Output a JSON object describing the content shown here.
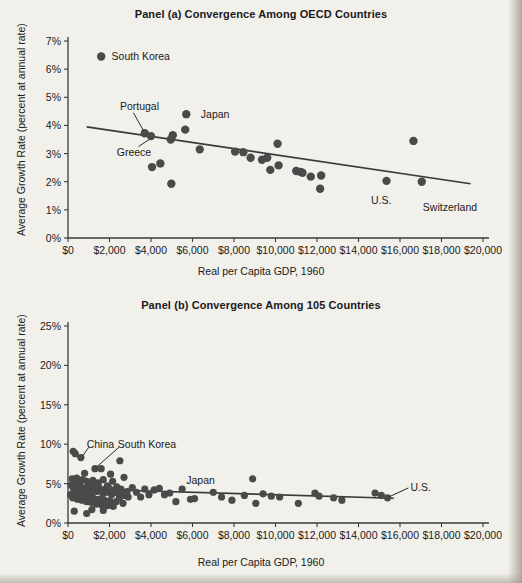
{
  "figure": {
    "xlabel": "Real per Capita GDP, 1960",
    "ylabel": "Average Growth Rate (percent at annual rate)"
  },
  "chart_data": [
    {
      "type": "scatter",
      "panel": "a",
      "title": "Panel (a) Convergence Among OECD Countries",
      "xlabel": "Real per Capita GDP, 1960",
      "ylabel": "Average Growth Rate (percent at annual rate)",
      "xlim": [
        0,
        20000
      ],
      "ylim": [
        0,
        7
      ],
      "grid": false,
      "legend": "none",
      "xticks": [
        0,
        2000,
        4000,
        6000,
        8000,
        10000,
        12000,
        14000,
        16000,
        18000,
        20000
      ],
      "xticklabels": [
        "$0",
        "$2,000",
        "$4,000",
        "$6,000",
        "$8,000",
        "$10,000",
        "$12,000",
        "$14,000",
        "$16,000",
        "$18,000",
        "$20,000"
      ],
      "yticks": [
        0,
        1,
        2,
        3,
        4,
        5,
        6,
        7
      ],
      "yticklabels": [
        "0%",
        "1%",
        "2%",
        "3%",
        "4%",
        "5%",
        "6%",
        "7%"
      ],
      "points": [
        {
          "x": 1600,
          "y": 6.45,
          "label": "South Korea"
        },
        {
          "x": 3700,
          "y": 3.72,
          "label": "Portugal"
        },
        {
          "x": 4000,
          "y": 3.62,
          "label": "Greece"
        },
        {
          "x": 4050,
          "y": 2.52,
          "label": ""
        },
        {
          "x": 4450,
          "y": 2.65,
          "label": ""
        },
        {
          "x": 4950,
          "y": 3.5,
          "label": ""
        },
        {
          "x": 5050,
          "y": 3.65,
          "label": ""
        },
        {
          "x": 4980,
          "y": 1.93,
          "label": ""
        },
        {
          "x": 5700,
          "y": 4.4,
          "label": "Japan"
        },
        {
          "x": 5650,
          "y": 3.85,
          "label": ""
        },
        {
          "x": 6350,
          "y": 3.15,
          "label": ""
        },
        {
          "x": 8050,
          "y": 3.07,
          "label": ""
        },
        {
          "x": 8450,
          "y": 3.05,
          "label": ""
        },
        {
          "x": 8800,
          "y": 2.85,
          "label": ""
        },
        {
          "x": 9350,
          "y": 2.78,
          "label": ""
        },
        {
          "x": 9600,
          "y": 2.85,
          "label": ""
        },
        {
          "x": 10100,
          "y": 3.35,
          "label": ""
        },
        {
          "x": 9750,
          "y": 2.42,
          "label": ""
        },
        {
          "x": 10150,
          "y": 2.58,
          "label": ""
        },
        {
          "x": 11000,
          "y": 2.38,
          "label": ""
        },
        {
          "x": 11200,
          "y": 2.35,
          "label": ""
        },
        {
          "x": 11300,
          "y": 2.32,
          "label": ""
        },
        {
          "x": 11700,
          "y": 2.18,
          "label": ""
        },
        {
          "x": 12200,
          "y": 2.22,
          "label": ""
        },
        {
          "x": 12150,
          "y": 1.75,
          "label": ""
        },
        {
          "x": 15350,
          "y": 2.03,
          "label": "U.S."
        },
        {
          "x": 16650,
          "y": 3.45,
          "label": ""
        },
        {
          "x": 17050,
          "y": 2.0,
          "label": "Switzerland"
        }
      ],
      "trendline": {
        "x0": 900,
        "y0": 3.95,
        "x1": 19400,
        "y1": 1.93
      },
      "annotations": [
        {
          "text": "South Korea",
          "x": 2100,
          "y": 6.45
        },
        {
          "text": "Portugal",
          "x": 2500,
          "y": 4.7
        },
        {
          "text": "Greece",
          "x": 2350,
          "y": 3.05
        },
        {
          "text": "Japan",
          "x": 6400,
          "y": 4.4
        },
        {
          "text": "U.S.",
          "x": 14600,
          "y": 1.35
        },
        {
          "text": "Switzerland",
          "x": 17100,
          "y": 1.1
        }
      ]
    },
    {
      "type": "scatter",
      "panel": "b",
      "title": "Panel (b) Convergence Among 105 Countries",
      "xlabel": "Real per Capita GDP, 1960",
      "ylabel": "Average Growth Rate (percent at annual rate)",
      "xlim": [
        0,
        20000
      ],
      "ylim": [
        0,
        25
      ],
      "grid": false,
      "legend": "none",
      "xticks": [
        0,
        2000,
        4000,
        6000,
        8000,
        10000,
        12000,
        14000,
        16000,
        18000,
        20000
      ],
      "xticklabels": [
        "$0",
        "$2,000",
        "$4,000",
        "$6,000",
        "$8,000",
        "$10,000",
        "$12,000",
        "$14,000",
        "$16,000",
        "$18,000",
        "$20,000"
      ],
      "yticks": [
        0,
        5,
        10,
        15,
        20,
        25
      ],
      "yticklabels": [
        "0%",
        "5%",
        "10%",
        "15%",
        "20%",
        "25%"
      ],
      "points": [
        {
          "x": 250,
          "y": 9.1,
          "label": ""
        },
        {
          "x": 350,
          "y": 8.8,
          "label": ""
        },
        {
          "x": 620,
          "y": 8.3,
          "label": "China"
        },
        {
          "x": 1300,
          "y": 6.9,
          "label": "South Korea"
        },
        {
          "x": 1600,
          "y": 6.9,
          "label": ""
        },
        {
          "x": 2500,
          "y": 7.9,
          "label": ""
        },
        {
          "x": 800,
          "y": 6.3,
          "label": ""
        },
        {
          "x": 2050,
          "y": 6.2,
          "label": ""
        },
        {
          "x": 2700,
          "y": 5.8,
          "label": ""
        },
        {
          "x": 200,
          "y": 5.6,
          "label": ""
        },
        {
          "x": 420,
          "y": 5.7,
          "label": ""
        },
        {
          "x": 560,
          "y": 5.2,
          "label": ""
        },
        {
          "x": 700,
          "y": 5.5,
          "label": ""
        },
        {
          "x": 900,
          "y": 5.3,
          "label": ""
        },
        {
          "x": 1050,
          "y": 5.0,
          "label": ""
        },
        {
          "x": 1200,
          "y": 5.4,
          "label": ""
        },
        {
          "x": 1450,
          "y": 5.1,
          "label": ""
        },
        {
          "x": 1700,
          "y": 5.5,
          "label": ""
        },
        {
          "x": 1900,
          "y": 4.7,
          "label": ""
        },
        {
          "x": 2150,
          "y": 5.3,
          "label": ""
        },
        {
          "x": 2350,
          "y": 4.6,
          "label": ""
        },
        {
          "x": 150,
          "y": 4.8,
          "label": ""
        },
        {
          "x": 260,
          "y": 4.4,
          "label": ""
        },
        {
          "x": 340,
          "y": 4.9,
          "label": ""
        },
        {
          "x": 430,
          "y": 4.2,
          "label": ""
        },
        {
          "x": 510,
          "y": 4.6,
          "label": ""
        },
        {
          "x": 600,
          "y": 4.0,
          "label": ""
        },
        {
          "x": 680,
          "y": 4.5,
          "label": ""
        },
        {
          "x": 760,
          "y": 3.9,
          "label": ""
        },
        {
          "x": 840,
          "y": 4.4,
          "label": ""
        },
        {
          "x": 930,
          "y": 4.1,
          "label": ""
        },
        {
          "x": 1010,
          "y": 4.7,
          "label": ""
        },
        {
          "x": 1100,
          "y": 4.2,
          "label": ""
        },
        {
          "x": 1180,
          "y": 3.8,
          "label": ""
        },
        {
          "x": 1280,
          "y": 4.5,
          "label": ""
        },
        {
          "x": 1380,
          "y": 4.0,
          "label": ""
        },
        {
          "x": 1480,
          "y": 4.6,
          "label": ""
        },
        {
          "x": 1580,
          "y": 4.1,
          "label": ""
        },
        {
          "x": 1680,
          "y": 3.7,
          "label": ""
        },
        {
          "x": 1790,
          "y": 4.3,
          "label": ""
        },
        {
          "x": 1880,
          "y": 3.9,
          "label": ""
        },
        {
          "x": 1980,
          "y": 4.4,
          "label": ""
        },
        {
          "x": 2100,
          "y": 3.6,
          "label": ""
        },
        {
          "x": 2250,
          "y": 4.2,
          "label": ""
        },
        {
          "x": 2400,
          "y": 3.8,
          "label": ""
        },
        {
          "x": 2550,
          "y": 4.3,
          "label": ""
        },
        {
          "x": 2700,
          "y": 3.5,
          "label": ""
        },
        {
          "x": 2850,
          "y": 4.0,
          "label": ""
        },
        {
          "x": 120,
          "y": 3.6,
          "label": ""
        },
        {
          "x": 230,
          "y": 3.2,
          "label": ""
        },
        {
          "x": 330,
          "y": 3.7,
          "label": ""
        },
        {
          "x": 450,
          "y": 3.0,
          "label": ""
        },
        {
          "x": 560,
          "y": 3.5,
          "label": ""
        },
        {
          "x": 670,
          "y": 2.9,
          "label": ""
        },
        {
          "x": 780,
          "y": 3.4,
          "label": ""
        },
        {
          "x": 890,
          "y": 2.7,
          "label": ""
        },
        {
          "x": 1000,
          "y": 3.3,
          "label": ""
        },
        {
          "x": 1120,
          "y": 2.6,
          "label": ""
        },
        {
          "x": 1240,
          "y": 3.1,
          "label": ""
        },
        {
          "x": 1360,
          "y": 2.4,
          "label": ""
        },
        {
          "x": 1490,
          "y": 3.0,
          "label": ""
        },
        {
          "x": 1620,
          "y": 2.3,
          "label": ""
        },
        {
          "x": 1750,
          "y": 2.9,
          "label": ""
        },
        {
          "x": 1890,
          "y": 2.2,
          "label": ""
        },
        {
          "x": 2020,
          "y": 2.8,
          "label": ""
        },
        {
          "x": 2180,
          "y": 2.1,
          "label": ""
        },
        {
          "x": 2320,
          "y": 2.7,
          "label": ""
        },
        {
          "x": 2480,
          "y": 3.2,
          "label": ""
        },
        {
          "x": 2650,
          "y": 2.5,
          "label": ""
        },
        {
          "x": 2900,
          "y": 3.3,
          "label": ""
        },
        {
          "x": 300,
          "y": 1.5,
          "label": ""
        },
        {
          "x": 900,
          "y": 1.2,
          "label": ""
        },
        {
          "x": 1150,
          "y": 1.7,
          "label": ""
        },
        {
          "x": 1700,
          "y": 1.6,
          "label": ""
        },
        {
          "x": 3100,
          "y": 4.5,
          "label": ""
        },
        {
          "x": 3300,
          "y": 3.9,
          "label": ""
        },
        {
          "x": 3500,
          "y": 3.3,
          "label": ""
        },
        {
          "x": 3700,
          "y": 4.3,
          "label": ""
        },
        {
          "x": 3900,
          "y": 3.6,
          "label": ""
        },
        {
          "x": 4150,
          "y": 4.2,
          "label": ""
        },
        {
          "x": 4400,
          "y": 4.4,
          "label": ""
        },
        {
          "x": 4650,
          "y": 3.6,
          "label": ""
        },
        {
          "x": 4900,
          "y": 3.8,
          "label": ""
        },
        {
          "x": 5200,
          "y": 2.7,
          "label": ""
        },
        {
          "x": 5500,
          "y": 4.3,
          "label": "Japan"
        },
        {
          "x": 5900,
          "y": 3.0,
          "label": ""
        },
        {
          "x": 6100,
          "y": 3.1,
          "label": ""
        },
        {
          "x": 7000,
          "y": 3.9,
          "label": ""
        },
        {
          "x": 7400,
          "y": 3.3,
          "label": ""
        },
        {
          "x": 7900,
          "y": 2.9,
          "label": ""
        },
        {
          "x": 8500,
          "y": 3.5,
          "label": ""
        },
        {
          "x": 8900,
          "y": 5.6,
          "label": ""
        },
        {
          "x": 9050,
          "y": 2.5,
          "label": ""
        },
        {
          "x": 9400,
          "y": 3.7,
          "label": ""
        },
        {
          "x": 9800,
          "y": 3.4,
          "label": ""
        },
        {
          "x": 10200,
          "y": 3.3,
          "label": ""
        },
        {
          "x": 11100,
          "y": 2.5,
          "label": ""
        },
        {
          "x": 11900,
          "y": 3.8,
          "label": ""
        },
        {
          "x": 12100,
          "y": 3.4,
          "label": ""
        },
        {
          "x": 12800,
          "y": 3.2,
          "label": ""
        },
        {
          "x": 13200,
          "y": 2.9,
          "label": ""
        },
        {
          "x": 14800,
          "y": 3.8,
          "label": ""
        },
        {
          "x": 15100,
          "y": 3.5,
          "label": ""
        },
        {
          "x": 15400,
          "y": 3.2,
          "label": "U.S."
        }
      ],
      "trendline": {
        "x0": 100,
        "y0": 4.35,
        "x1": 15700,
        "y1": 3.15
      },
      "annotations": [
        {
          "text": "China",
          "x": 900,
          "y": 10.0
        },
        {
          "text": "South Korea",
          "x": 2400,
          "y": 10.0
        },
        {
          "text": "Japan",
          "x": 5700,
          "y": 5.4
        },
        {
          "text": "U.S.",
          "x": 16500,
          "y": 4.6
        }
      ]
    }
  ]
}
